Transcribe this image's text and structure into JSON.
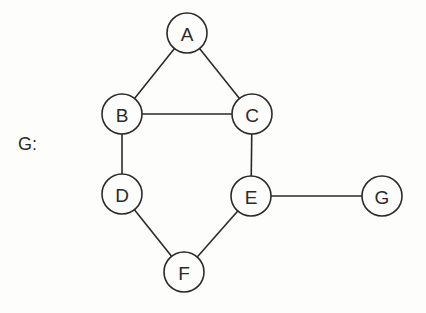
{
  "graph": {
    "label": "G:",
    "style": {
      "stroke": "#2a2a2a",
      "node_fill": "#fdfdfc",
      "text_color": "#2a2a2a",
      "node_radius": 20,
      "stroke_width": 1.6,
      "font_size": 19
    },
    "nodes": [
      {
        "id": "A",
        "label": "A",
        "x": 187,
        "y": 33
      },
      {
        "id": "B",
        "label": "B",
        "x": 122,
        "y": 114
      },
      {
        "id": "C",
        "label": "C",
        "x": 252,
        "y": 114
      },
      {
        "id": "D",
        "label": "D",
        "x": 122,
        "y": 194
      },
      {
        "id": "E",
        "label": "E",
        "x": 251,
        "y": 196
      },
      {
        "id": "F",
        "label": "F",
        "x": 184,
        "y": 272
      },
      {
        "id": "G",
        "label": "G",
        "x": 382,
        "y": 196
      }
    ],
    "edges": [
      {
        "from": "A",
        "to": "B"
      },
      {
        "from": "A",
        "to": "C"
      },
      {
        "from": "B",
        "to": "C"
      },
      {
        "from": "B",
        "to": "D"
      },
      {
        "from": "C",
        "to": "E"
      },
      {
        "from": "D",
        "to": "F"
      },
      {
        "from": "E",
        "to": "F"
      },
      {
        "from": "E",
        "to": "G"
      }
    ]
  }
}
